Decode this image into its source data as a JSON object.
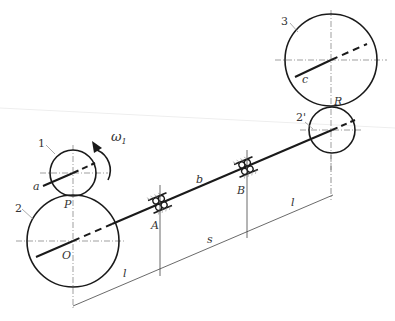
{
  "diagram": {
    "type": "gear-train",
    "gears": [
      {
        "id": "1",
        "label": "1",
        "cx": 73,
        "cy": 173,
        "r": 23
      },
      {
        "id": "2",
        "label": "2",
        "cx": 73,
        "cy": 241,
        "r": 46
      },
      {
        "id": "2p",
        "label": "2'",
        "cx": 332,
        "cy": 130,
        "r": 23
      },
      {
        "id": "3",
        "label": "3",
        "cx": 331,
        "cy": 60,
        "r": 46
      }
    ],
    "points": {
      "P": "P",
      "O": "O",
      "R": "R",
      "A": "A",
      "B": "B"
    },
    "shafts": {
      "a": "a",
      "b": "b",
      "c": "c"
    },
    "angular_velocity": "ω",
    "angular_velocity_sub": "1",
    "dimensions": {
      "l_left": "l",
      "s": "s",
      "l_right": "l"
    },
    "colors": {
      "stroke": "#1a1a1a",
      "thin": "#555555",
      "bg": "#ffffff"
    }
  }
}
